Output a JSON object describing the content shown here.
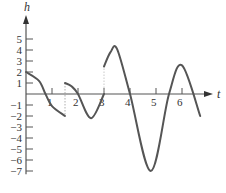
{
  "chart_data": {
    "type": "line",
    "title": "",
    "xlabel": "t",
    "ylabel": "h",
    "xlim": [
      0,
      7
    ],
    "ylim": [
      -7,
      5
    ],
    "x_ticks": [
      "1",
      "2",
      "3",
      "4",
      "5",
      "6"
    ],
    "y_ticks": [
      "5",
      "4",
      "3",
      "2",
      "1",
      "-1",
      "-2",
      "-3",
      "-4",
      "-5",
      "-6",
      "-7"
    ],
    "grid": false,
    "series": [
      {
        "name": "segment-1",
        "x": [
          0,
          0.5,
          0.75,
          1.0,
          1.5
        ],
        "values": [
          2,
          1.2,
          0,
          -1.1,
          -2
        ]
      },
      {
        "name": "segment-2",
        "x": [
          1.5,
          1.75,
          2.0,
          2.5,
          3.0
        ],
        "values": [
          1,
          0.7,
          0,
          -2.2,
          0
        ]
      },
      {
        "name": "segment-3",
        "x": [
          3.0,
          3.25,
          3.5,
          4.0,
          4.8,
          5.5,
          6.0,
          6.7
        ],
        "values": [
          2.5,
          3.8,
          4.1,
          0,
          -7,
          0,
          2.6,
          -2
        ]
      }
    ],
    "annotations": [
      "dotted vertical line at t=1.5",
      "dashed gap at t=3 from h=0 to h=2.5"
    ],
    "colors": {
      "curve": "#555555",
      "axis": "#555555"
    }
  }
}
